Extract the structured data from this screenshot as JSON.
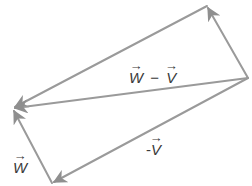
{
  "diagram": {
    "title": "",
    "stroke_color": "#9a9a9a",
    "vertices": {
      "top": [
        207,
        6
      ],
      "right": [
        248,
        78
      ],
      "left": [
        13,
        108
      ],
      "bottom": [
        52,
        183
      ]
    },
    "vectors": [
      {
        "id": "top-to-left",
        "from": "top",
        "to": "left",
        "label": ""
      },
      {
        "id": "w-minus-v",
        "from": "right",
        "to": "left",
        "label": "w − v"
      },
      {
        "id": "w",
        "from": "bottom",
        "to": "left",
        "label": "w"
      },
      {
        "id": "neg-v",
        "from": "right",
        "to": "bottom",
        "label": "-v"
      },
      {
        "id": "right-to-top",
        "from": "right",
        "to": "top",
        "label": ""
      }
    ],
    "labels": {
      "w_minus_v_w": "W",
      "w_minus_v_op": "−",
      "w_minus_v_v": "V",
      "neg_v_sign": "-",
      "neg_v_v": "V",
      "w": "W"
    }
  }
}
